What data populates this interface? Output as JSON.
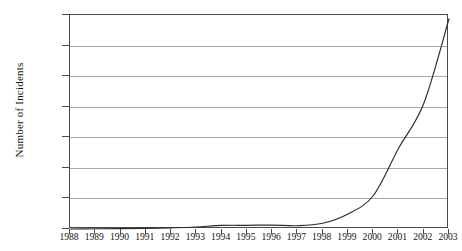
{
  "chart_data": {
    "type": "line",
    "title": "",
    "xlabel": "",
    "ylabel": "Number of Incidents",
    "x": [
      1988,
      1989,
      1990,
      1991,
      1992,
      1993,
      1994,
      1995,
      1996,
      1997,
      1998,
      1999,
      2000,
      2001,
      2002,
      2003
    ],
    "values": [
      6,
      132,
      252,
      406,
      773,
      1334,
      2340,
      2412,
      2573,
      2134,
      3734,
      9859,
      21756,
      52658,
      82094,
      137529
    ],
    "series": [
      {
        "name": "Number of Incidents",
        "values": [
          6,
          132,
          252,
          406,
          773,
          1334,
          2340,
          2412,
          2573,
          2134,
          3734,
          9859,
          21756,
          52658,
          82094,
          137529
        ]
      }
    ],
    "categories": [
      "1988",
      "1989",
      "1990",
      "1991",
      "1992",
      "1993",
      "1994",
      "1995",
      "1996",
      "1997",
      "1998",
      "1999",
      "2000",
      "2001",
      "2002",
      "2003"
    ],
    "xtick_labels": [
      "1988",
      "1989",
      "1990",
      "1991",
      "1992",
      "1993",
      "1994",
      "1995",
      "1996",
      "1997",
      "1998",
      "1999",
      "2000",
      "2001",
      "2002",
      "2003"
    ],
    "ytick_labels": [
      "0",
      "20000",
      "40000",
      "60000",
      "80000",
      "100000",
      "120000",
      "140000"
    ],
    "yticks": [
      0,
      20000,
      40000,
      60000,
      80000,
      100000,
      120000,
      140000
    ],
    "ylim": [
      0,
      140000
    ],
    "xlim": [
      1988,
      2003
    ],
    "grid": "horizontal",
    "legend": "none",
    "line_color": "#2b2b2b",
    "grid_color": "#a7a7a7",
    "frame_color": "#4a4a4a"
  }
}
